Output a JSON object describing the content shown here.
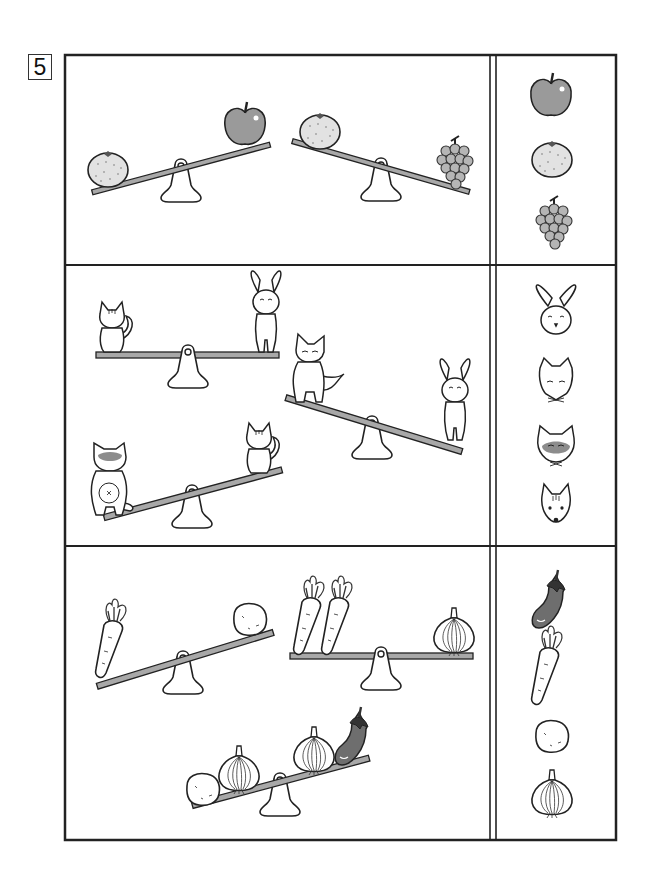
{
  "worksheet": {
    "question_number": "5",
    "layout": {
      "frame": {
        "x": 64,
        "y": 54,
        "w": 552,
        "h": 786
      },
      "divider_x": [
        490,
        497
      ],
      "row_splits_y": [
        265,
        546
      ]
    },
    "colors": {
      "line": "#222222",
      "beam_fill": "#a8a8a8",
      "apple_fill": "#9a9a9a",
      "orange_fill": "#e2e2e2",
      "grape_fill": "#b5b5b5",
      "eggplant_fill": "#6e6e6e",
      "raccoon_mask": "#8c8c8c"
    },
    "rows": [
      {
        "name": "fruits",
        "seesaws": [
          {
            "left": [
              "orange"
            ],
            "right": [
              "apple"
            ],
            "heavier": "left",
            "tilt": "left-down"
          },
          {
            "left": [
              "orange"
            ],
            "right": [
              "grapes"
            ],
            "heavier": "right",
            "tilt": "right-down"
          }
        ],
        "answer_items": [
          "apple",
          "orange",
          "grapes"
        ]
      },
      {
        "name": "animals",
        "seesaws": [
          {
            "left": [
              "squirrel"
            ],
            "right": [
              "rabbit"
            ],
            "heavier": "equal",
            "tilt": "level"
          },
          {
            "left": [
              "fox"
            ],
            "right": [
              "rabbit"
            ],
            "heavier": "right",
            "tilt": "right-down"
          },
          {
            "left": [
              "raccoon"
            ],
            "right": [
              "squirrel"
            ],
            "heavier": "left",
            "tilt": "left-down"
          }
        ],
        "answer_items": [
          "rabbit",
          "fox",
          "raccoon",
          "squirrel"
        ]
      },
      {
        "name": "vegetables",
        "seesaws": [
          {
            "left": [
              "carrot"
            ],
            "right": [
              "potato"
            ],
            "heavier": "left",
            "tilt": "left-down"
          },
          {
            "left": [
              "carrot",
              "carrot"
            ],
            "right": [
              "onion"
            ],
            "heavier": "equal",
            "tilt": "level"
          },
          {
            "left": [
              "potato",
              "onion"
            ],
            "right": [
              "onion",
              "eggplant"
            ],
            "heavier": "left",
            "tilt": "left-down"
          }
        ],
        "answer_items": [
          "eggplant",
          "carrot",
          "potato",
          "onion"
        ]
      }
    ]
  }
}
